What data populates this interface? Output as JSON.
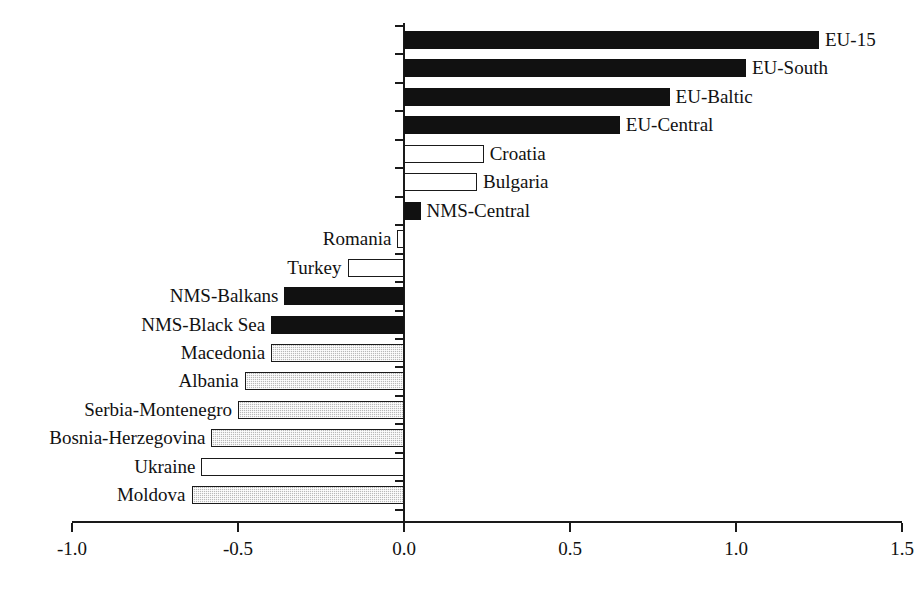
{
  "chart_data": {
    "type": "bar",
    "orientation": "horizontal",
    "title": "",
    "subtitle": "",
    "xlabel": "",
    "ylabel": "",
    "xlim": [
      -1.0,
      1.5
    ],
    "grid": false,
    "legend": "none",
    "x_ticks": [
      "-1.0",
      "-0.5",
      "0.0",
      "0.5",
      "1.0",
      "1.5"
    ],
    "x_tick_values": [
      -1.0,
      -0.5,
      0.0,
      0.5,
      1.0,
      1.5
    ],
    "categories": [
      "EU-15",
      "EU-South",
      "EU-Baltic",
      "EU-Central",
      "Croatia",
      "Bulgaria",
      "NMS-Central",
      "Romania",
      "Turkey",
      "NMS-Balkans",
      "NMS-Black Sea",
      "Macedonia",
      "Albania",
      "Serbia-Montenegro",
      "Bosnia-Herzegovina",
      "Ukraine",
      "Moldova"
    ],
    "values": [
      1.25,
      1.03,
      0.8,
      0.65,
      0.24,
      0.22,
      0.05,
      -0.02,
      -0.17,
      -0.36,
      -0.4,
      -0.4,
      -0.48,
      -0.5,
      -0.58,
      -0.61,
      -0.64
    ],
    "bar_styles": [
      "black",
      "black",
      "black",
      "black",
      "white",
      "white",
      "black",
      "white",
      "white",
      "black",
      "black",
      "hatch",
      "hatch",
      "hatch",
      "hatch",
      "white",
      "hatch"
    ]
  },
  "colors": {
    "axis": "#1a1a1a",
    "bar_black": "#111111",
    "bar_white": "#ffffff",
    "bar_hatch": "#b9b9b9",
    "background": "#ffffff"
  }
}
